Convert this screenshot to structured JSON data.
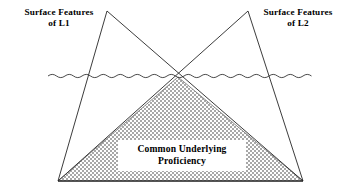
{
  "figure": {
    "background_color": "#ffffff",
    "line_color": "#1a1a1a",
    "stipple_color": "#8c8c8c",
    "text_color": "#000000"
  },
  "labels": {
    "left": {
      "line1": "Surface Features",
      "line2": "of L1"
    },
    "right": {
      "line1": "Surface Features",
      "line2": "of L2"
    },
    "center": {
      "line1": "Common Underlying",
      "line2": "Proficiency"
    }
  },
  "diagram_data": {
    "type": "diagram",
    "shapes": [
      {
        "name": "triangle-l1",
        "role": "surface-features-of-l1",
        "points": "107,11 303,181 58,181",
        "fill": "none",
        "stroke": "#1a1a1a"
      },
      {
        "name": "triangle-l2",
        "role": "surface-features-of-l2",
        "points": "248,11 303,181 58,181",
        "fill": "none",
        "stroke": "#1a1a1a"
      },
      {
        "name": "triangle-common-underlying-proficiency",
        "role": "common-underlying-proficiency",
        "points": "178,77 303,181 58,181",
        "fill": "stipple",
        "stroke": "#6e6e6e"
      }
    ],
    "waterline": {
      "name": "wavy-waterline",
      "y": 76,
      "x_start": 48,
      "x_end": 314,
      "wavelength": 17,
      "amplitude": 2.4
    },
    "crossing_point": {
      "x": 178,
      "y": 77
    },
    "apex_left": {
      "x": 107,
      "y": 11
    },
    "apex_right": {
      "x": 248,
      "y": 11
    },
    "base_left": {
      "x": 58,
      "y": 181
    },
    "base_right": {
      "x": 303,
      "y": 181
    }
  }
}
